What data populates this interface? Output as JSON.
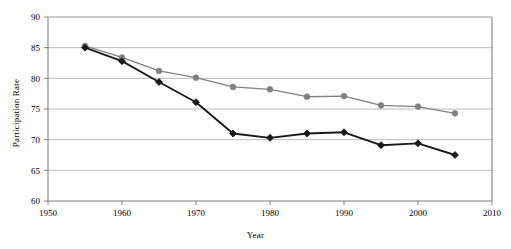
{
  "chart_data": {
    "type": "line",
    "title": "",
    "xlabel": "Year",
    "ylabel": "Participation Rate",
    "x": [
      1955,
      1960,
      1965,
      1970,
      1975,
      1980,
      1985,
      1990,
      1995,
      2000,
      2005
    ],
    "xlim": [
      1950,
      2010
    ],
    "ylim": [
      60,
      90
    ],
    "xticks": [
      1950,
      1960,
      1970,
      1980,
      1990,
      2000,
      2010
    ],
    "xtick_labels": [
      "1950",
      "1960",
      "1970",
      "1980",
      "1990",
      "2000",
      "2010"
    ],
    "yticks": [
      60,
      65,
      70,
      75,
      80,
      85,
      90
    ],
    "ytick_labels": [
      "60",
      "65",
      "70",
      "75",
      "80",
      "85",
      "90"
    ],
    "grid": "horizontal",
    "legend": "none",
    "series": [
      {
        "name": "gray-series",
        "marker": "circle",
        "color": "#808080",
        "values": [
          85.3,
          83.4,
          81.2,
          80.1,
          78.6,
          78.2,
          77.0,
          77.1,
          75.6,
          75.4,
          74.3
        ]
      },
      {
        "name": "black-series",
        "marker": "diamond",
        "color": "#1a1a1a",
        "values": [
          85.0,
          82.8,
          79.4,
          76.1,
          71.0,
          70.3,
          71.0,
          71.2,
          69.1,
          69.4,
          67.5
        ]
      }
    ]
  },
  "axes": {
    "x_title": "Year",
    "y_title": "Participation Rate"
  },
  "colors": {
    "gray_series": "#808080",
    "black_series": "#1a1a1a",
    "gridline": "#b3b3b3",
    "axis": "#808080",
    "background": "#ffffff"
  }
}
